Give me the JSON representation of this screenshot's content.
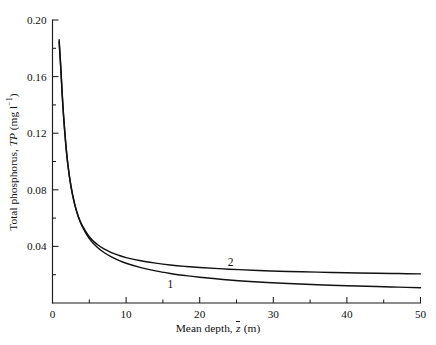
{
  "chart_data": {
    "type": "line",
    "title": "",
    "xlabel_plain": "Mean depth, z̄ (m)",
    "ylabel_plain": "Total phosphorus, TP (mg l⁻¹)",
    "xlabel_parts": {
      "prefix": "Mean depth, ",
      "symbol": "z",
      "suffix": " (m)"
    },
    "ylabel_parts": {
      "prefix": "Total phosphorus, ",
      "symbol": "TP",
      "unit_open": " (mg l",
      "unit_exp": "−1",
      "unit_close": ")"
    },
    "xlim": [
      0,
      50
    ],
    "ylim": [
      0,
      0.2
    ],
    "grid": false,
    "legend_position": "inline-annotations",
    "x_major_ticks": [
      0,
      10,
      20,
      30,
      40,
      50
    ],
    "x_major_labels": [
      "0",
      "10",
      "20",
      "30",
      "40",
      "50"
    ],
    "x_minor_ticks": [
      5,
      15,
      25,
      35,
      45
    ],
    "y_major_ticks": [
      0.04,
      0.08,
      0.12,
      0.16,
      0.2
    ],
    "y_major_labels": [
      "0.04",
      "0.08",
      "0.12",
      "0.16",
      "0.20"
    ],
    "y_minor_ticks": [
      0.02,
      0.06,
      0.1,
      0.14,
      0.18
    ],
    "annotations": [
      {
        "text": "1",
        "x": 16.0,
        "y": 0.0105,
        "curve": "1"
      },
      {
        "text": "2",
        "x": 24.2,
        "y": 0.0262,
        "curve": "2"
      }
    ],
    "series": [
      {
        "name": "1",
        "label": "1",
        "x": [
          0.9,
          1.1,
          1.3,
          1.5,
          1.8,
          2.1,
          2.5,
          3.0,
          3.5,
          4.0,
          5.0,
          6.0,
          7.0,
          8.0,
          9.0,
          10.0,
          12.0,
          14.0,
          16.0,
          18.0,
          20.0,
          24.0,
          28.0,
          32.0,
          36.0,
          40.0,
          44.0,
          47.0,
          50.0
        ],
        "y": [
          0.186,
          0.169,
          0.15,
          0.133,
          0.113,
          0.0975,
          0.083,
          0.07,
          0.061,
          0.0545,
          0.0455,
          0.0398,
          0.0357,
          0.0326,
          0.0301,
          0.0281,
          0.025,
          0.0227,
          0.0209,
          0.0194,
          0.0182,
          0.0163,
          0.0149,
          0.0138,
          0.0129,
          0.0122,
          0.0116,
          0.0112,
          0.0108
        ]
      },
      {
        "name": "2",
        "label": "2",
        "x": [
          0.9,
          1.1,
          1.3,
          1.5,
          1.8,
          2.1,
          2.5,
          3.0,
          3.5,
          4.0,
          5.0,
          6.0,
          7.0,
          8.0,
          9.0,
          10.0,
          12.0,
          14.0,
          16.0,
          18.0,
          20.0,
          24.0,
          28.0,
          32.0,
          36.0,
          40.0,
          44.0,
          47.0,
          50.0
        ],
        "y": [
          0.1845,
          0.1675,
          0.1487,
          0.132,
          0.1122,
          0.097,
          0.0826,
          0.07,
          0.0613,
          0.0552,
          0.0468,
          0.0417,
          0.0382,
          0.0356,
          0.0337,
          0.0321,
          0.0298,
          0.0282,
          0.0269,
          0.0259,
          0.0251,
          0.0239,
          0.023,
          0.0223,
          0.0218,
          0.0214,
          0.021,
          0.0208,
          0.0206
        ]
      }
    ]
  },
  "colors": {
    "curve": "#111111",
    "axis": "#1b1b1b",
    "background": "#ffffff"
  }
}
